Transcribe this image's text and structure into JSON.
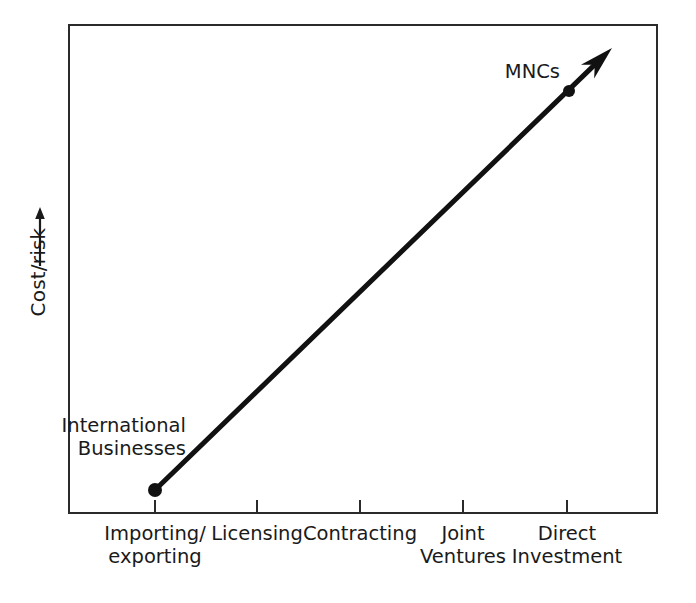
{
  "figure": {
    "background_color": "#ffffff",
    "ink_color": "#1a1a1a",
    "frame_color": "#2b2b2b"
  },
  "axes": {
    "y": {
      "label": "Cost/risk",
      "arrow_icon": "up-arrow-icon",
      "direction": "increasing upward",
      "ticks": []
    },
    "x": {
      "label": "",
      "tick_labels": [
        "Importing/\nexporting",
        "Licensing",
        "Contracting",
        "Joint\nVentures",
        "Direct\nInvestment"
      ]
    }
  },
  "annotations": [
    {
      "name": "international-businesses",
      "text": "International\nBusinesses"
    },
    {
      "name": "mncs",
      "text": "MNCs"
    }
  ],
  "chart_data": {
    "type": "line",
    "title": "",
    "subtitle": "",
    "xlabel": "",
    "ylabel": "Cost/risk",
    "grid": false,
    "legend": null,
    "categories": [
      "Importing/exporting",
      "Licensing",
      "Contracting",
      "Joint Ventures",
      "Direct Investment"
    ],
    "x": [
      1,
      2,
      3,
      4,
      5
    ],
    "xlim": [
      0.5,
      5.9
    ],
    "ylim": [
      0,
      10
    ],
    "series": [
      {
        "name": "Cost/risk of market entry mode",
        "values": [
          1.1,
          3.2,
          5.3,
          7.4,
          9.0
        ],
        "marker_points": [
          {
            "label": "International Businesses",
            "x": 1,
            "y": 1.1
          },
          {
            "label": "MNCs",
            "x": 5,
            "y": 9.0
          }
        ],
        "line_style": "solid",
        "line_width_px": 5,
        "arrow_head_at_end": true,
        "color": "#111111"
      }
    ]
  },
  "geometry": {
    "plot_box": {
      "x": 68,
      "y": 24,
      "width": 590,
      "height": 490
    },
    "tick_x_positions": [
      155,
      257,
      360,
      463,
      567
    ],
    "tick_y": 514,
    "tick_length": 14,
    "line_start": {
      "x": 155,
      "y": 490
    },
    "line_end": {
      "x": 612,
      "y": 48
    },
    "dots": [
      {
        "name": "international-businesses-dot",
        "x": 155,
        "y": 490,
        "r": 7
      },
      {
        "name": "mncs-dot",
        "x": 569,
        "y": 91,
        "r": 6
      }
    ]
  }
}
